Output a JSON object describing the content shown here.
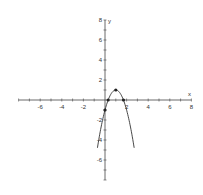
{
  "chart_data": {
    "type": "line",
    "title": "",
    "xlabel": "x",
    "ylabel": "y",
    "xlim": [
      -8,
      8
    ],
    "ylim": [
      -8,
      8
    ],
    "grid": false,
    "x_ticks": [
      -6,
      -4,
      -2,
      2,
      4,
      6,
      8
    ],
    "y_ticks": [
      8,
      6,
      4,
      2,
      -2,
      -4,
      -6
    ],
    "series": [
      {
        "name": "y = -2x^2 + 4x - 1",
        "kind": "parabola",
        "coefficients": {
          "a": -2,
          "b": 4,
          "c": -1
        },
        "x_range": [
          -0.7,
          2.7
        ]
      }
    ],
    "points": [
      {
        "label": "vertex",
        "x": 1,
        "y": 1
      },
      {
        "label": "y-intercept",
        "x": 0,
        "y": -1
      },
      {
        "label": "root-1",
        "x": 0.29,
        "y": 0
      },
      {
        "label": "root-2",
        "x": 1.71,
        "y": 0
      }
    ]
  },
  "axis_labels": {
    "x": "x",
    "y": "y"
  }
}
